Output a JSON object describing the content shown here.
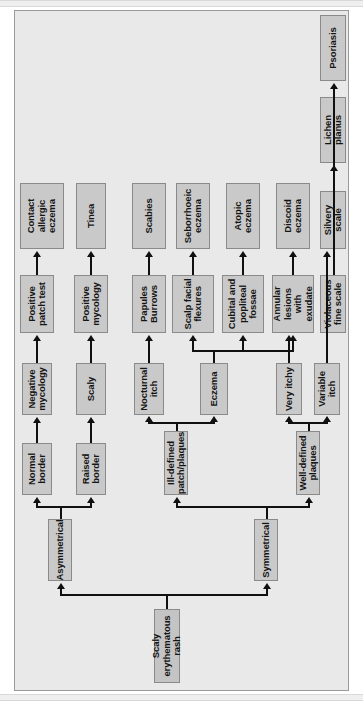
{
  "diagram": {
    "orientation": "rotated-90-ccw",
    "colors": {
      "plate_background": "#e9e9e9",
      "node_fill": "#c9c9c9",
      "node_border": "#8a8a8a",
      "connector": "#101010",
      "page_background": "#ffffff"
    },
    "root": "Scaly erythematous rash",
    "nodes": {
      "root": "Scaly erythematous rash",
      "asymmetrical": "Asymmetrical",
      "symmetrical": "Symmetrical",
      "normal_border": "Normal border",
      "raised_border": "Raised border",
      "negative_mycology": "Negative mycology",
      "scaly": "Scaly",
      "positive_patch_test": "Positive patch test",
      "positive_mycology": "Positive mycology",
      "contact_allergic_eczema": "Contact allergic eczema",
      "tinea": "Tinea",
      "ill_defined_patch_plaques": "Ill-defined patch/plaques",
      "well_defined_plaques": "Well-defined plaques",
      "nocturnal_itch": "Nocturnal itch",
      "eczema": "Eczema",
      "papules_burrows": "Papules Burrows",
      "scabies": "Scabies",
      "scalp_facial_flexures": "Scalp facial flexures",
      "cubital_popliteal_fossae": "Cubital and popliteal fossae",
      "annular_lesions_exudate": "Annular lesions with exudate",
      "seborrhoeic_eczema": "Seborrhoeic eczema",
      "atopic_eczema": "Atopic eczema",
      "discoid_eczema": "Discoid eczema",
      "very_itchy": "Very itchy",
      "variable_itch": "Variable itch",
      "violaceous_fine_scale": "Violaceous fine scale",
      "silvery_scale": "Silvery scale",
      "lichen_planus": "Lichen planus",
      "psoriasis": "Psoriasis"
    },
    "edges": [
      {
        "from": "root",
        "to": "asymmetrical"
      },
      {
        "from": "root",
        "to": "symmetrical"
      },
      {
        "from": "asymmetrical",
        "to": "normal_border"
      },
      {
        "from": "asymmetrical",
        "to": "raised_border"
      },
      {
        "from": "normal_border",
        "to": "negative_mycology"
      },
      {
        "from": "negative_mycology",
        "to": "positive_patch_test"
      },
      {
        "from": "positive_patch_test",
        "to": "contact_allergic_eczema"
      },
      {
        "from": "raised_border",
        "to": "scaly"
      },
      {
        "from": "scaly",
        "to": "positive_mycology"
      },
      {
        "from": "positive_mycology",
        "to": "tinea"
      },
      {
        "from": "symmetrical",
        "to": "ill_defined_patch_plaques"
      },
      {
        "from": "symmetrical",
        "to": "well_defined_plaques"
      },
      {
        "from": "ill_defined_patch_plaques",
        "to": "nocturnal_itch"
      },
      {
        "from": "ill_defined_patch_plaques",
        "to": "eczema"
      },
      {
        "from": "nocturnal_itch",
        "to": "papules_burrows"
      },
      {
        "from": "papules_burrows",
        "to": "scabies"
      },
      {
        "from": "eczema",
        "to": "scalp_facial_flexures"
      },
      {
        "from": "eczema",
        "to": "cubital_popliteal_fossae"
      },
      {
        "from": "eczema",
        "to": "annular_lesions_exudate"
      },
      {
        "from": "scalp_facial_flexures",
        "to": "seborrhoeic_eczema"
      },
      {
        "from": "cubital_popliteal_fossae",
        "to": "atopic_eczema"
      },
      {
        "from": "annular_lesions_exudate",
        "to": "discoid_eczema"
      },
      {
        "from": "well_defined_plaques",
        "to": "very_itchy"
      },
      {
        "from": "well_defined_plaques",
        "to": "variable_itch"
      },
      {
        "from": "very_itchy",
        "to": "violaceous_fine_scale"
      },
      {
        "from": "violaceous_fine_scale",
        "to": "lichen_planus"
      },
      {
        "from": "variable_itch",
        "to": "silvery_scale"
      },
      {
        "from": "silvery_scale",
        "to": "psoriasis"
      }
    ]
  }
}
